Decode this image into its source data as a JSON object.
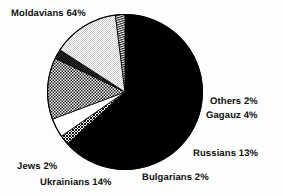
{
  "chart_data": {
    "type": "pie",
    "title": "",
    "subtitle": "",
    "xlabel": "",
    "ylabel": "",
    "legend_position": "none",
    "grid": false,
    "units": "percent",
    "categories": [
      "Moldavians",
      "Others",
      "Gagauz",
      "Russians",
      "Bulgarians",
      "Ukrainians",
      "Jews"
    ],
    "values": [
      64,
      2,
      4,
      13,
      2,
      14,
      2
    ],
    "labels": [
      "Moldavians 64%",
      "Others 2%",
      "Gagauz 4%",
      "Russians 13%",
      "Bulgarians 2%",
      "Ukrainians 14%",
      "Jews 2%"
    ],
    "slices": [
      {
        "name": "Moldavians",
        "value": 64,
        "label": "Moldavians 64%",
        "fill": "solid-black",
        "color": "#000000"
      },
      {
        "name": "Others",
        "value": 2,
        "label": "Others 2%",
        "fill": "dark-crosshatch",
        "color": "#2a2a2a"
      },
      {
        "name": "Gagauz",
        "value": 4,
        "label": "Gagauz 4%",
        "fill": "white",
        "color": "#ffffff"
      },
      {
        "name": "Russians",
        "value": 13,
        "label": "Russians 13%",
        "fill": "medium-crosshatch",
        "color": "#8c8c8c"
      },
      {
        "name": "Bulgarians",
        "value": 2,
        "label": "Bulgarians 2%",
        "fill": "dark-gray",
        "color": "#3a3a3a"
      },
      {
        "name": "Ukrainians",
        "value": 14,
        "label": "Ukrainians 14%",
        "fill": "light-gray",
        "color": "#dcdcdc"
      },
      {
        "name": "Jews",
        "value": 2,
        "label": "Jews 2%",
        "fill": "fine-stripe",
        "color": "#9a9a9a"
      }
    ],
    "start_angle_deg": 0,
    "direction": "clockwise",
    "outline_color": "#000000",
    "background_color": "#ffffff"
  },
  "labels": {
    "moldavians": "Moldavians 64%",
    "others": "Others 2%",
    "gagauz": "Gagauz 4%",
    "russians": "Russians 13%",
    "bulgarians": "Bulgarians 2%",
    "ukrainians": "Ukrainians 14%",
    "jews": "Jews 2%"
  }
}
